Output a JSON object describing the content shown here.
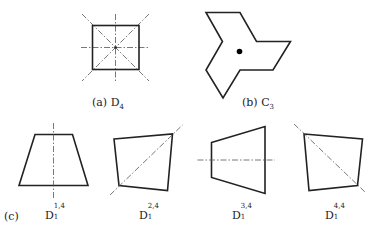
{
  "figure": {
    "panel_a": {
      "label_prefix": "(a)",
      "group": "D",
      "subscript": "4",
      "shape": "square",
      "square": {
        "x1": 92.5,
        "y1": 25.5,
        "x2": 139,
        "y2": 69.5
      },
      "center": [
        115.5,
        47.5
      ],
      "axes": [
        {
          "x1": 115.5,
          "y1": 14,
          "x2": 115.5,
          "y2": 82
        },
        {
          "x1": 81,
          "y1": 47.5,
          "x2": 150,
          "y2": 47.5
        },
        {
          "x1": 82,
          "y1": 14,
          "x2": 149,
          "y2": 81
        },
        {
          "x1": 149,
          "y1": 14,
          "x2": 82,
          "y2": 81
        }
      ]
    },
    "panel_b": {
      "label_prefix": "(b)",
      "group": "C",
      "subscript": "3",
      "shape": "three-armed pinwheel polygon",
      "points": [
        [
          206,
          12.5
        ],
        [
          240,
          12.5
        ],
        [
          256.5,
          41.5
        ],
        [
          290.5,
          41.5
        ],
        [
          273,
          70
        ],
        [
          240,
          70
        ],
        [
          223,
          98
        ],
        [
          206,
          70
        ],
        [
          222.5,
          41.5
        ]
      ],
      "center_dot": [
        239.5,
        51.5
      ]
    },
    "panel_c": {
      "label_prefix": "(c)",
      "items": [
        {
          "group": "D",
          "subscript": "1",
          "superscript": "1,4",
          "points": [
            [
              35,
              134.5
            ],
            [
              72.5,
              134.5
            ],
            [
              88,
              185.5
            ],
            [
              19,
              185.5
            ]
          ],
          "axis": {
            "x1": 53.5,
            "y1": 123,
            "x2": 53.5,
            "y2": 198
          }
        },
        {
          "group": "D",
          "subscript": "1",
          "superscript": "2,4",
          "points": [
            [
              114,
              139
            ],
            [
              172.5,
              134
            ],
            [
              167.5,
              190.5
            ],
            [
              119,
              185.5
            ]
          ],
          "axis": {
            "x1": 110,
            "y1": 195,
            "x2": 182.5,
            "y2": 125
          }
        },
        {
          "group": "D",
          "subscript": "1",
          "superscript": "3,4",
          "points": [
            [
              211.5,
              142.5
            ],
            [
              265,
              126.5
            ],
            [
              265,
              193.5
            ],
            [
              211.5,
              177.5
            ]
          ],
          "axis": {
            "x1": 197.5,
            "y1": 160,
            "x2": 275,
            "y2": 160
          }
        },
        {
          "group": "D",
          "subscript": "1",
          "superscript": "4,4",
          "points": [
            [
              304,
              134
            ],
            [
              362.5,
              139
            ],
            [
              357.5,
              185.5
            ],
            [
              309,
              190.5
            ]
          ],
          "axis": {
            "x1": 294,
            "y1": 124,
            "x2": 365,
            "y2": 192
          }
        }
      ]
    }
  },
  "colors": {
    "stroke": "#222222",
    "axis": "#555555",
    "background": "#ffffff"
  }
}
